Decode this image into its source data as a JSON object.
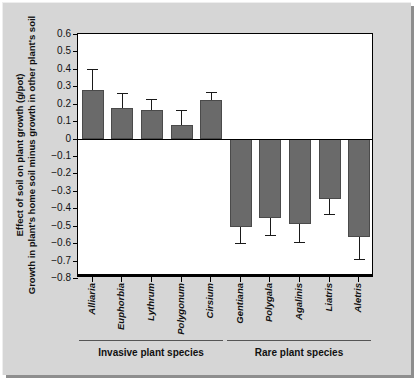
{
  "chart_data": {
    "type": "bar",
    "title": "",
    "xlabel": "",
    "ylabel_line1": "Effect of soil on plant growth (g/pot)",
    "ylabel_line2": "Growth in plant's home soil minus growth in other plant's soil",
    "ylim": [
      -0.8,
      0.6
    ],
    "ytick_labels": [
      "0.6",
      "0.5",
      "0.4",
      "0.3",
      "0.2",
      "0.1",
      "0",
      "−0.1",
      "−0.2",
      "−0.3",
      "−0.4",
      "−0.5",
      "−0.6",
      "−0.7",
      "−0.8"
    ],
    "ytick_values": [
      0.6,
      0.5,
      0.4,
      0.3,
      0.2,
      0.1,
      0,
      -0.1,
      -0.2,
      -0.3,
      -0.4,
      -0.5,
      -0.6,
      -0.7,
      -0.8
    ],
    "grid": false,
    "legend": "none",
    "categories": [
      "Alliaria",
      "Euphorbia",
      "Lythrum",
      "Polygonum",
      "Cirsium",
      "Gentiana",
      "Polygala",
      "Agalinis",
      "Liatris",
      "Aletris"
    ],
    "values": [
      0.28,
      0.175,
      0.165,
      0.08,
      0.22,
      -0.51,
      -0.455,
      -0.49,
      -0.345,
      -0.565
    ],
    "error_high": [
      0.4,
      0.26,
      0.225,
      0.165,
      0.27,
      -0.51,
      -0.455,
      -0.49,
      -0.345,
      -0.565
    ],
    "error_low": [
      0.28,
      0.175,
      0.165,
      0.08,
      0.22,
      -0.6,
      -0.555,
      -0.595,
      -0.43,
      -0.69
    ],
    "bar_color": "#6a6a6a",
    "groups": [
      {
        "label": "Invasive plant species",
        "start": 0,
        "end": 4
      },
      {
        "label": "Rare plant species",
        "start": 5,
        "end": 9
      }
    ]
  },
  "figure": {
    "background_color": "#d6d6d6",
    "plot_background_color": "#ffffff"
  }
}
